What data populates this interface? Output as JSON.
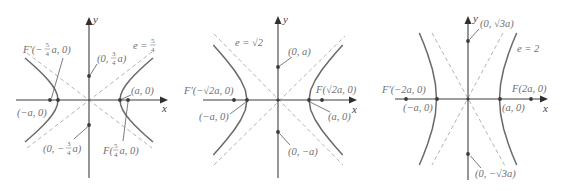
{
  "figures": [
    {
      "axis_labels": {
        "x": "x",
        "y": "y"
      },
      "eccentricity": {
        "prefix": "e =",
        "num": "5",
        "den": "4"
      },
      "focus_left": {
        "prefix": "F′(−",
        "num": "5",
        "den": "4",
        "suffix": "a, 0)"
      },
      "focus_right": {
        "prefix": "F(",
        "num": "5",
        "den": "4",
        "suffix": "a, 0)"
      },
      "vertex_left": "(−a, 0)",
      "vertex_right": "(a, 0)",
      "covertex_top": {
        "prefix": "(0,",
        "num": "3",
        "den": "4",
        "suffix": "a)"
      },
      "covertex_bottom": {
        "prefix": "(0, −",
        "num": "3",
        "den": "4",
        "suffix": "a)"
      }
    },
    {
      "axis_labels": {
        "x": "x",
        "y": "y"
      },
      "eccentricity": "e = √2",
      "focus_left": "F′(−√2a, 0)",
      "focus_right": "F(√2a, 0)",
      "vertex_left": "(−a, 0)",
      "vertex_right": "(a, 0)",
      "covertex_top": "(0, a)",
      "covertex_bottom": "(0, −a)"
    },
    {
      "axis_labels": {
        "x": "x",
        "y": "y"
      },
      "eccentricity": "e = 2",
      "focus_left": "F′(−2a, 0)",
      "focus_right": "F(2a, 0)",
      "vertex_left": "(−a, 0)",
      "vertex_right": "(a, 0)",
      "covertex_top": "(0, √3a)",
      "covertex_bottom": "(0, −√3a)"
    }
  ]
}
